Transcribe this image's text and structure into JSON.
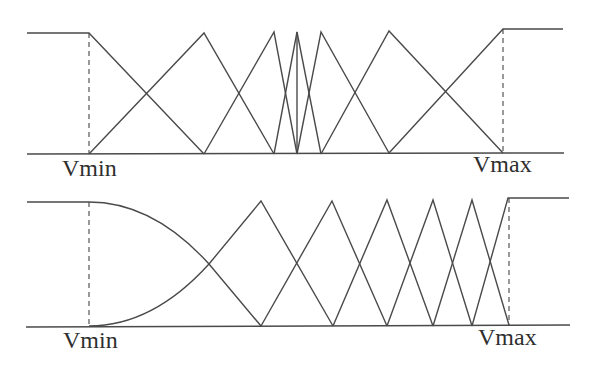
{
  "figure": {
    "line_color": "#4a4a4a",
    "background": "#ffffff"
  },
  "diagrams": [
    {
      "id": "top",
      "name": "top-partition-diagram",
      "labels": {
        "min": {
          "text": "Vmin",
          "x": 62,
          "y": 176
        },
        "max": {
          "text": "Vmax",
          "x": 473,
          "y": 172
        }
      },
      "baseline": "M27,154 L564,153",
      "dashed": [
        "M89,33 L89,154",
        "M503,29 L503,153"
      ],
      "functions": [
        {
          "name": "left-shoulder-mf",
          "d": "M27,33 L89,33 L204,154"
        },
        {
          "name": "triangle-mf-1",
          "d": "M89,154 L204,33 L274,154"
        },
        {
          "name": "triangle-mf-2",
          "d": "M204,154 L274,32 L297,154"
        },
        {
          "name": "triangle-mf-3",
          "d": "M274,154 L297,32 L321,154"
        },
        {
          "name": "singleton-spike-mf",
          "d": "M297,154 L297,32"
        },
        {
          "name": "triangle-mf-4",
          "d": "M297,154 L321,32 L389,153"
        },
        {
          "name": "triangle-mf-5",
          "d": "M321,154 L389,31 L503,153"
        },
        {
          "name": "right-shoulder-mf",
          "d": "M389,153 L503,29 L563,29"
        }
      ]
    },
    {
      "id": "bottom",
      "name": "bottom-partition-diagram",
      "labels": {
        "min": {
          "text": "Vmin",
          "x": 63,
          "y": 348
        },
        "max": {
          "text": "Vmax",
          "x": 478,
          "y": 345
        }
      },
      "baseline": "M26,327 L570,325",
      "dashed": [
        "M89,202 L89,327",
        "M509,198 L509,325"
      ],
      "functions": [
        {
          "name": "left-shoulder-curved-mf",
          "d": "M27,202 L89,202 C140,202 180,232 209,264 L261,326"
        },
        {
          "name": "curved-rise-triangle-mf",
          "d": "M89,326 C140,326 180,296 209,264 L261,201 L333,326"
        },
        {
          "name": "triangle-mf-1",
          "d": "M261,326 L332,201 L387,326"
        },
        {
          "name": "triangle-mf-2",
          "d": "M333,326 L387,200 L433,326"
        },
        {
          "name": "triangle-mf-3",
          "d": "M387,326 L433,200 L472,326"
        },
        {
          "name": "triangle-mf-4",
          "d": "M433,326 L472,200 L509,325"
        },
        {
          "name": "right-shoulder-mf",
          "d": "M472,326 L508,198 L569,198"
        }
      ]
    }
  ]
}
